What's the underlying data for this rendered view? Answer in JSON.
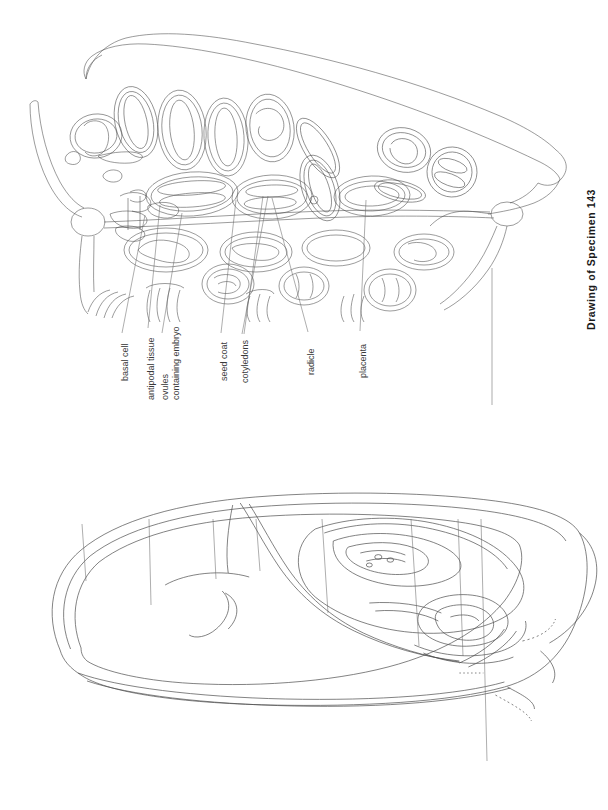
{
  "page": {
    "width": 608,
    "height": 810,
    "background": "#ffffff",
    "ink_color": "#3a3a3a",
    "caption_color": "#1a1a1a",
    "leader_color": "#6a6a6a"
  },
  "figures": [
    {
      "id": "specimen-143",
      "caption": "Drawing of Specimen 143",
      "subject": "longitudinal section of an ovary containing ovules with developing embryos",
      "labels": [
        {
          "text": "basal cell",
          "lines": [
            "basal cell"
          ],
          "x": 120,
          "text_bottom": 381,
          "leader_from_y": 333,
          "leader_to": {
            "x": 145,
            "y": 215
          }
        },
        {
          "text": "antipodal tissue",
          "lines": [
            "antipodal tissue"
          ],
          "x": 146,
          "text_bottom": 400,
          "leader_from_y": 328,
          "leader_to": {
            "x": 160,
            "y": 205
          }
        },
        {
          "text": "ovules containing embryo",
          "lines": [
            "ovules",
            "containing embryo"
          ],
          "x": 160,
          "text_bottom": 400,
          "leader_from_y": 333,
          "leader_to": {
            "x": 182,
            "y": 213
          }
        },
        {
          "text": "seed coat",
          "lines": [
            "seed coat"
          ],
          "x": 219,
          "text_bottom": 381,
          "leader_from_y": 333,
          "leader_to": {
            "x": 236,
            "y": 200
          }
        },
        {
          "text": "cotyledons",
          "lines": [
            "cotyledons"
          ],
          "x": 240,
          "text_bottom": 383,
          "leader_from_y": 334,
          "leader_to": {
            "x": 268,
            "y": 196
          }
        },
        {
          "text": "radicle",
          "lines": [
            "radicle"
          ],
          "x": 306,
          "text_bottom": 375,
          "leader_from_y": 332,
          "leader_to": {
            "x": 272,
            "y": 198
          }
        },
        {
          "text": "placenta",
          "lines": [
            "placenta"
          ],
          "x": 358,
          "text_bottom": 378,
          "leader_from_y": 331,
          "leader_to": {
            "x": 366,
            "y": 200
          }
        }
      ]
    },
    {
      "id": "specimen-142",
      "caption": "Drawing of Specimen 142",
      "subject": "longitudinal section of a caryopsis (grain) showing embryo and endosperm",
      "labels": [
        {
          "text": "united integuments and ovary wall",
          "lines": [
            "united integuments",
            "and ovary wall"
          ],
          "x": 80,
          "text_bottom": 518,
          "leader_from_y": 524,
          "leader_to": {
            "x": 86,
            "y": 580
          }
        },
        {
          "text": "endosperm",
          "lines": [
            "endosperm"
          ],
          "x": 147,
          "text_bottom": 512,
          "leader_from_y": 519,
          "leader_to": {
            "x": 150,
            "y": 604
          }
        },
        {
          "text": "cotyledon",
          "lines": [
            "cotyledon"
          ],
          "x": 211,
          "text_bottom": 512,
          "leader_from_y": 519,
          "leader_to": {
            "x": 215,
            "y": 578
          }
        },
        {
          "text": "coleoptile",
          "lines": [
            "coleoptile"
          ],
          "x": 254,
          "text_bottom": 512,
          "leader_from_y": 519,
          "leader_to": {
            "x": 259,
            "y": 570
          }
        },
        {
          "text": "plumule",
          "lines": [
            "plumule"
          ],
          "x": 320,
          "text_bottom": 512,
          "leader_from_y": 519,
          "leader_to": {
            "x": 326,
            "y": 612
          }
        },
        {
          "text": "radicle",
          "lines": [
            "radicle"
          ],
          "x": 409,
          "text_bottom": 512,
          "leader_from_y": 519,
          "leader_to": {
            "x": 418,
            "y": 645
          }
        },
        {
          "text": "coleorhiza",
          "lines": [
            "coleorhiza"
          ],
          "x": 456,
          "text_bottom": 512,
          "leader_from_y": 519,
          "leader_to": {
            "x": 461,
            "y": 655
          }
        },
        {
          "text": "ovary wall",
          "lines": [
            "ovary wall"
          ],
          "x": 479,
          "text_bottom": 512,
          "leader_from_y": 519,
          "leader_to": {
            "x": 486,
            "y": 760
          }
        }
      ]
    }
  ]
}
